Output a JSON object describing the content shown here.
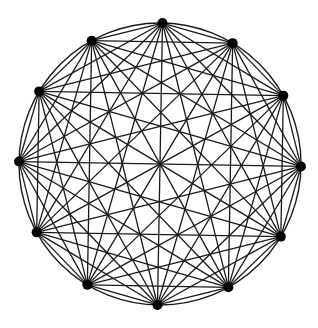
{
  "diagram": {
    "title": "Complete graph K12",
    "type": "complete-graph",
    "vertex_count": 12,
    "layout": "circular",
    "center": [
      160,
      164
    ],
    "radius": 141,
    "start_angle_deg": -89,
    "draw_circumcircle": true,
    "colors": {
      "edge": "#1a1a1a",
      "vertex": "#000000",
      "background": "#ffffff"
    },
    "vertex_radius": 5
  }
}
